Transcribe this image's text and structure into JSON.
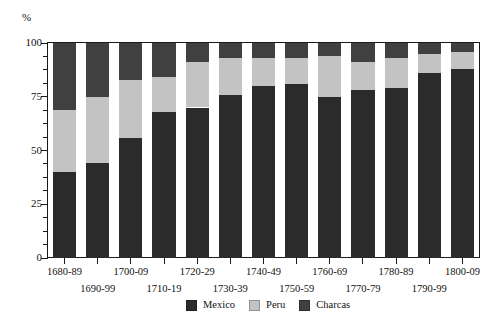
{
  "axes": {
    "y_unit_label": "%",
    "y_ticks_major": [
      "0",
      "25",
      "50",
      "75",
      "100"
    ],
    "x_labels_row_a": [
      "1680-89",
      "1700-09",
      "1720-29",
      "1740-49",
      "1760-69",
      "1780-89",
      "1800-09"
    ],
    "x_labels_row_b": [
      "1690-99",
      "1710-19",
      "1730-39",
      "1750-59",
      "1770-79",
      "1790-99"
    ]
  },
  "legend": {
    "items": [
      {
        "label": "Mexico",
        "color": "#2b2b2b",
        "swatch": "legend-swatch-mexico"
      },
      {
        "label": "Peru",
        "color": "#c3c3c3",
        "swatch": "legend-swatch-peru"
      },
      {
        "label": "Charcas",
        "color": "#404040",
        "swatch": "legend-swatch-charcas"
      }
    ]
  },
  "colors": {
    "mexico": "#2b2b2b",
    "peru": "#c3c3c3",
    "charcas": "#404040",
    "axis": "#1a1a1a",
    "background": "#ffffff"
  },
  "chart_data": {
    "type": "bar",
    "title": "",
    "subtitle": "",
    "xlabel": "",
    "ylabel": "%",
    "ylim": [
      0,
      100
    ],
    "grid": false,
    "stacked": true,
    "stacked_mode": "percent",
    "legend_position": "bottom",
    "categories": [
      "1680-89",
      "1690-99",
      "1700-09",
      "1710-19",
      "1720-29",
      "1730-39",
      "1740-49",
      "1750-59",
      "1760-69",
      "1770-79",
      "1780-89",
      "1790-99",
      "1800-09"
    ],
    "series": [
      {
        "name": "Mexico",
        "color": "#2b2b2b",
        "values": [
          40,
          44,
          56,
          68,
          70,
          76,
          80,
          81,
          75,
          78,
          79,
          86,
          88
        ]
      },
      {
        "name": "Peru",
        "color": "#c3c3c3",
        "values": [
          29,
          31,
          27,
          16,
          21,
          17,
          13,
          12,
          19,
          13,
          14,
          9,
          8
        ]
      },
      {
        "name": "Charcas",
        "color": "#404040",
        "values": [
          31,
          25,
          17,
          16,
          9,
          7,
          7,
          7,
          6,
          9,
          7,
          5,
          4
        ]
      }
    ],
    "cumulative_tops": {
      "mexico_top": [
        40,
        44,
        56,
        68,
        70,
        76,
        80,
        81,
        75,
        78,
        79,
        86,
        88
      ],
      "peru_top": [
        69,
        75,
        83,
        84,
        91,
        93,
        93,
        93,
        94,
        91,
        93,
        95,
        96
      ],
      "charcas_top": [
        100,
        100,
        100,
        100,
        100,
        100,
        100,
        100,
        100,
        100,
        100,
        100,
        100
      ]
    },
    "ytick_values": [
      0,
      25,
      50,
      75,
      100
    ],
    "yminor_step": 6.25
  }
}
